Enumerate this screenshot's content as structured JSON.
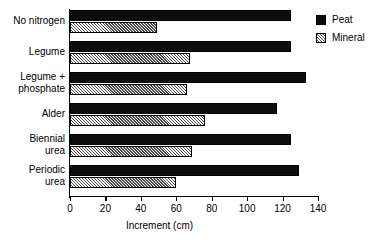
{
  "chart_data": {
    "type": "bar",
    "orientation": "horizontal",
    "title": "",
    "xlabel": "Increment (cm)",
    "ylabel": "",
    "xlim": [
      0,
      140
    ],
    "xticks": [
      0,
      20,
      40,
      60,
      80,
      100,
      120,
      140
    ],
    "xtick_labels": [
      "0",
      "20",
      "40",
      "60",
      "80",
      "100",
      "120",
      "140"
    ],
    "grid": false,
    "legend_position": "top-right",
    "categories": [
      "No nitrogen",
      "Legume",
      "Legume +\nphosphate",
      "Alder",
      "Biennial\nurea",
      "Periodic\nurea"
    ],
    "series": [
      {
        "name": "Peat",
        "pattern": "solid",
        "color": "#0d0d0d",
        "values": [
          125,
          125,
          133,
          117,
          125,
          129
        ]
      },
      {
        "name": "Mineral",
        "pattern": "hatched",
        "color": "#d8d8d8",
        "values": [
          49,
          68,
          66,
          76,
          69,
          60
        ]
      }
    ]
  },
  "legend": {
    "items": [
      {
        "label": "Peat"
      },
      {
        "label": "Mineral"
      }
    ]
  },
  "axis": {
    "x_title": "Increment (cm)"
  }
}
